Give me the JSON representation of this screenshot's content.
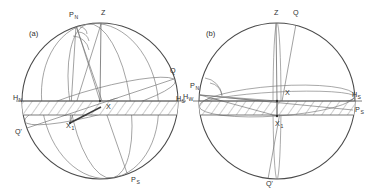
{
  "figure": {
    "background_color": "#ffffff",
    "line_color": "#6a6a6a",
    "label_color": "#2e2e2e",
    "width": 378,
    "height": 196
  },
  "panels": [
    {
      "id": "a",
      "caption": "(a)",
      "center_x": 100,
      "center_y": 101,
      "radius": 78,
      "labels": [
        {
          "name": "north-celestial-pole",
          "base": "P",
          "sub": "N",
          "x": 69,
          "y": 17
        },
        {
          "name": "zenith",
          "base": "Z",
          "sub": "",
          "x": 101,
          "y": 15
        },
        {
          "name": "equator-point-q",
          "base": "Q",
          "sub": "",
          "x": 170,
          "y": 73
        },
        {
          "name": "horizon-north",
          "base": "H",
          "sub": "N",
          "x": 13,
          "y": 100
        },
        {
          "name": "horizon-south",
          "base": "H",
          "sub": "S",
          "x": 176,
          "y": 101
        },
        {
          "name": "body-x",
          "base": "X",
          "sub": "",
          "x": 106,
          "y": 109
        },
        {
          "name": "body-x1",
          "base": "X",
          "sub": "1",
          "x": 66,
          "y": 128
        },
        {
          "name": "equator-point-q-prime",
          "base": "Q'",
          "sub": "",
          "x": 15,
          "y": 134
        },
        {
          "name": "south-celestial-pole",
          "base": "P",
          "sub": "S",
          "x": 131,
          "y": 182
        }
      ]
    },
    {
      "id": "b",
      "caption": "(b)",
      "center_x": 277,
      "center_y": 101,
      "radius": 78,
      "labels": [
        {
          "name": "zenith",
          "base": "Z",
          "sub": "",
          "x": 274,
          "y": 15
        },
        {
          "name": "equator-point-q",
          "base": "Q",
          "sub": "",
          "x": 293,
          "y": 15
        },
        {
          "name": "north-celestial-pole",
          "base": "P",
          "sub": "N",
          "x": 190,
          "y": 88
        },
        {
          "name": "horizon-west",
          "base": "H",
          "sub": "W",
          "x": 183,
          "y": 99
        },
        {
          "name": "body-x",
          "base": "X",
          "sub": "",
          "x": 285,
          "y": 95
        },
        {
          "name": "horizon-south",
          "base": "H",
          "sub": "S",
          "x": 352,
          "y": 97
        },
        {
          "name": "south-celestial-pole",
          "base": "P",
          "sub": "S",
          "x": 355,
          "y": 112
        },
        {
          "name": "body-x1",
          "base": "X",
          "sub": "1",
          "x": 275,
          "y": 126
        },
        {
          "name": "equator-point-q-prime",
          "base": "Q'",
          "sub": "",
          "x": 266,
          "y": 186
        }
      ]
    }
  ]
}
